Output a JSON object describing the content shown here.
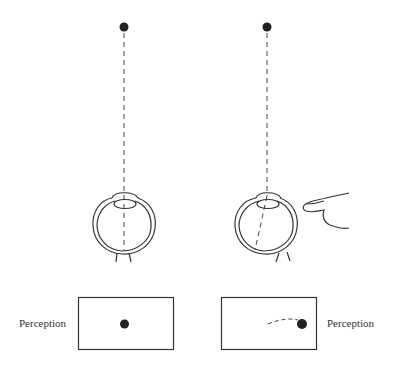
{
  "diagram": {
    "left_panel": {
      "condition": "normal eye",
      "perception_label": "Perception"
    },
    "right_panel": {
      "condition": "eye pressed by finger",
      "perception_label": "Perception"
    },
    "colors": {
      "stroke": "#333333",
      "dot": "#222222",
      "background": "#ffffff"
    }
  }
}
